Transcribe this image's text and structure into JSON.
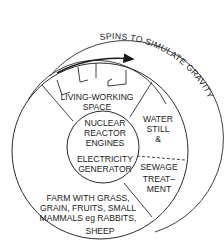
{
  "diagram": {
    "title_curved": "SPINS TO SIMULATE GRAVITY",
    "sections": {
      "living": [
        "LIVING-WORKING",
        "SPACE"
      ],
      "core": [
        "NUCLEAR",
        "REACTOR",
        "ENGINES",
        "ELECTRICITY",
        "GENERATOR"
      ],
      "water": [
        "WATER",
        "STILL",
        "&"
      ],
      "sewage": [
        "SEWAGE",
        "TREAT–",
        "MENT"
      ],
      "farm": [
        "FARM WITH GRASS,",
        "GRAIN, FRUITS, SMALL",
        "MAMMALS eg RABBITS,",
        "SHEEP"
      ]
    },
    "colors": {
      "line": "#2a2a2a",
      "text": "#1a1a1a",
      "background": "#ffffff"
    }
  }
}
